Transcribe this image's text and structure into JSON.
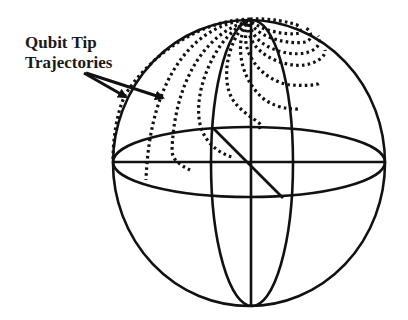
{
  "figure": {
    "label_line1": "Qubit Tip",
    "label_line2": "Trajectories",
    "colors": {
      "ink": "#111111",
      "background": "#ffffff"
    }
  }
}
